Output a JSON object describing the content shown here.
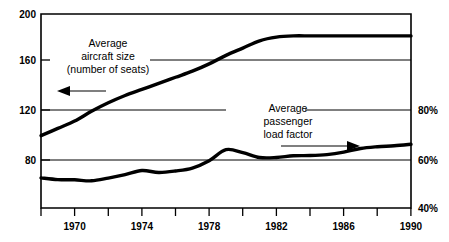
{
  "chart_data": {
    "type": "line",
    "title": "",
    "subtitle": "",
    "xlabel": "",
    "ylabel": "",
    "grid": true,
    "legend_position": "inline-annotations",
    "x_axis": {
      "min": 1968,
      "max": 1990,
      "tick_labels": [
        "1970",
        "1974",
        "1978",
        "1982",
        "1986",
        "1990"
      ],
      "tick_values": [
        1970,
        1974,
        1978,
        1982,
        1986,
        1990
      ],
      "minor_tick_values": [
        1968,
        1970,
        1972,
        1974,
        1976,
        1978,
        1980,
        1982,
        1984,
        1986,
        1988,
        1990
      ]
    },
    "y_axis_left": {
      "name": "Average aircraft size (number of seats)",
      "min": 40,
      "max": 200,
      "tick_labels": [
        "200",
        "160",
        "120",
        "80"
      ],
      "tick_values": [
        200,
        160,
        120,
        80
      ]
    },
    "y_axis_right": {
      "name": "Average passenger load factor",
      "min": 40,
      "max": 100,
      "tick_labels": [
        "80%",
        "60%",
        "40%"
      ],
      "tick_values": [
        80,
        60,
        40
      ]
    },
    "series": [
      {
        "name": "Average aircraft size (number of seats)",
        "axis": "left",
        "x": [
          1968,
          1969,
          1970,
          1971,
          1972,
          1973,
          1974,
          1975,
          1976,
          1977,
          1978,
          1979,
          1980,
          1981,
          1982,
          1983,
          1984,
          1985,
          1986,
          1987,
          1988,
          1989,
          1990
        ],
        "values": [
          100,
          106,
          112,
          120,
          127,
          133,
          138,
          143,
          148,
          153,
          159,
          166,
          172,
          178,
          181,
          182,
          182,
          182,
          182,
          182,
          182,
          182,
          182
        ]
      },
      {
        "name": "Average passenger load factor",
        "axis": "right",
        "x": [
          1968,
          1969,
          1970,
          1971,
          1972,
          1973,
          1974,
          1975,
          1976,
          1977,
          1978,
          1979,
          1980,
          1981,
          1982,
          1983,
          1984,
          1985,
          1986,
          1987,
          1988,
          1989,
          1990
        ],
        "values": [
          52.3,
          51.6,
          51.5,
          51.1,
          52.2,
          53.6,
          55.3,
          54.5,
          55.1,
          56.3,
          59.3,
          63.8,
          62.6,
          60.6,
          60.6,
          61.3,
          61.4,
          61.8,
          62.8,
          64.3,
          65.0,
          65.4,
          66.0
        ]
      }
    ],
    "annotations": [
      {
        "id": "aircraft-size",
        "lines": [
          "Average",
          "aircraft size",
          "(number of seats)"
        ],
        "arrow_direction": "left",
        "points_to_axis": "left"
      },
      {
        "id": "load-factor",
        "lines": [
          "Average",
          "passenger",
          "load factor"
        ],
        "arrow_direction": "right",
        "points_to_axis": "right"
      }
    ],
    "colors": {
      "line": "#000000",
      "axis": "#000000",
      "grid": "#000000",
      "background": "#ffffff"
    }
  }
}
